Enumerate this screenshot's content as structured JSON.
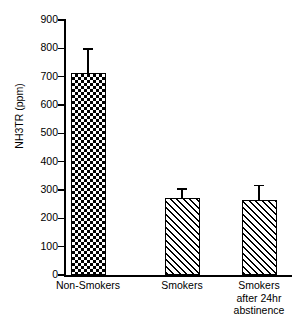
{
  "chart_data": {
    "type": "bar",
    "title": "",
    "xlabel": "",
    "ylabel": "NH3TR (ppm)",
    "categories": [
      "Non-Smokers",
      "Smokers",
      "Smokers after 24hr abstinence"
    ],
    "category_lines": [
      [
        "Non-Smokers"
      ],
      [
        "Smokers"
      ],
      [
        "Smokers",
        "after 24hr",
        "abstinence"
      ]
    ],
    "values": [
      713,
      272,
      266
    ],
    "errors_upper": [
      87,
      35,
      52
    ],
    "ylim": [
      0,
      900
    ],
    "yticks": [
      0,
      100,
      200,
      300,
      400,
      500,
      600,
      700,
      800,
      900
    ],
    "ytick_labels": [
      "0",
      "100",
      "200",
      "300",
      "400",
      "500",
      "600",
      "700",
      "800",
      "900"
    ],
    "grid": false,
    "legend": "none",
    "series": [
      {
        "name": "NH3TR",
        "values": [
          713,
          272,
          266
        ],
        "errors_upper": [
          87,
          35,
          52
        ],
        "fills": [
          "checkerboard",
          "diagonal-hatch",
          "diagonal-hatch"
        ]
      }
    ],
    "colors": {
      "axis": "#000000",
      "bar_edge": "#000000",
      "bar_fill": "#ffffff",
      "pattern": "#000000",
      "background": "#ffffff"
    }
  }
}
